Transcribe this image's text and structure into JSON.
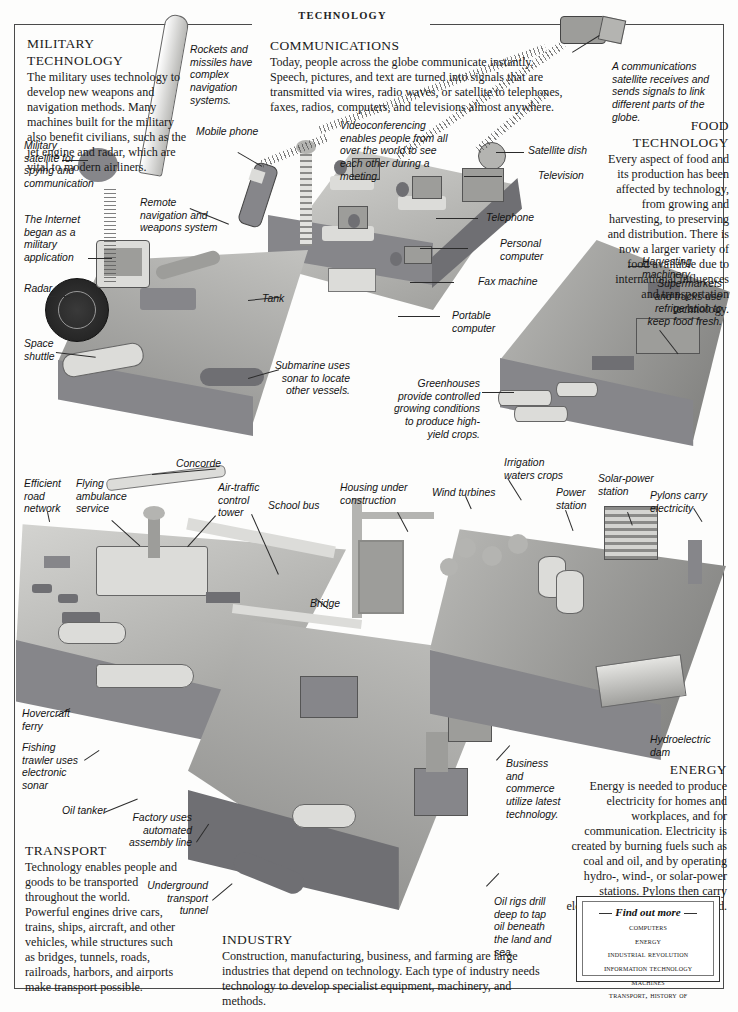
{
  "header": {
    "title": "TECHNOLOGY"
  },
  "sections": {
    "military": {
      "title_line1": "MILITARY",
      "title_line2": "TECHNOLOGY",
      "body": "The military uses technology to develop new weapons and navigation methods. Many machines built for the military also benefit civilians, such as the jet engine and radar, which are vital to modern airliners."
    },
    "communications": {
      "title": "COMMUNICATIONS",
      "body": "Today, people across the globe communicate instantly. Speech, pictures, and text are turned into signals that are transmitted via wires, radio waves, or satellite to telephones, faxes, radios, computers, and televisions almost anywhere."
    },
    "food": {
      "title": "FOOD TECHNOLOGY",
      "body": "Every aspect of food and its production has been affected by technology, from growing and harvesting, to preserving and distribution. There is now a larger variety of food available due to international influences and transportation technology."
    },
    "transport": {
      "title": "TRANSPORT",
      "body": "Technology enables people and goods to be transported throughout the world. Powerful engines drive cars, trains, ships, aircraft, and other vehicles, while structures such as bridges, tunnels, roads, railroads, harbors, and airports make transport possible."
    },
    "industry": {
      "title": "INDUSTRY",
      "body": "Construction, manufacturing, business, and farming are large industries that depend on technology. Each type of industry needs technology to develop specialist equipment, machinery, and methods."
    },
    "energy": {
      "title": "ENERGY",
      "body": "Energy is needed to produce electricity for homes and workplaces, and for communication. Electricity is created by burning fuels such as coal and oil, and by operating hydro-, wind-, or solar-power stations. Pylons then carry electricity to where it is required."
    }
  },
  "captions": {
    "rockets": "Rockets and missiles have complex navigation systems.",
    "military_satellite": "Military satellite for spying and communication",
    "internet": "The Internet began as a military application",
    "radar": "Radar",
    "space_shuttle": "Space shuttle",
    "remote_nav": "Remote navigation and weapons system",
    "tank": "Tank",
    "submarine": "Submarine uses sonar to locate other vessels.",
    "mobile_phone": "Mobile phone",
    "videoconferencing": "Videoconferencing enables people from all over the world to see each other during a meeting.",
    "satellite_dish": "Satellite dish",
    "television": "Television",
    "telephone": "Telephone",
    "personal_computer": "Personal computer",
    "fax_machine": "Fax machine",
    "portable_computer": "Portable computer",
    "comms_satellite": "A communications satellite receives and sends signals to link different parts of the globe.",
    "harvesting": "Harvesting machinery",
    "supermarkets": "Supermarkets and trucks use refrigeration to keep food fresh.",
    "greenhouses": "Greenhouses provide controlled growing conditions to produce high-yield crops.",
    "irrigation": "Irrigation waters crops",
    "solar": "Solar-power station",
    "pylons": "Pylons carry electricity",
    "wind_turbines": "Wind turbines",
    "power_station": "Power station",
    "hydroelectric": "Hydroelectric dam",
    "concorde": "Concorde",
    "efficient_road": "Efficient road network",
    "flying_ambulance": "Flying ambulance service",
    "air_traffic": "Air-traffic control tower",
    "school_bus": "School bus",
    "housing": "Housing under construction",
    "bridge": "Bridge",
    "hovercraft": "Hovercraft ferry",
    "fishing_trawler": "Fishing trawler uses electronic sonar",
    "oil_tanker": "Oil tanker",
    "factory": "Factory uses automated assembly line",
    "underground": "Underground transport tunnel",
    "business": "Business and commerce utilize latest technology.",
    "oil_rigs": "Oil rigs drill deep to tap oil beneath the land and sea."
  },
  "find_out_more": {
    "title": "Find out more",
    "items": [
      "COMPUTERS",
      "ENERGY",
      "INDUSTRIAL REVOLUTION",
      "INFORMATION TECHNOLOGY",
      "MACHINES",
      "TRANSPORT, HISTORY OF"
    ]
  },
  "colors": {
    "ink": "#1a1a1a",
    "rule": "#4a4a4a",
    "paper": "#fdfdfc"
  }
}
